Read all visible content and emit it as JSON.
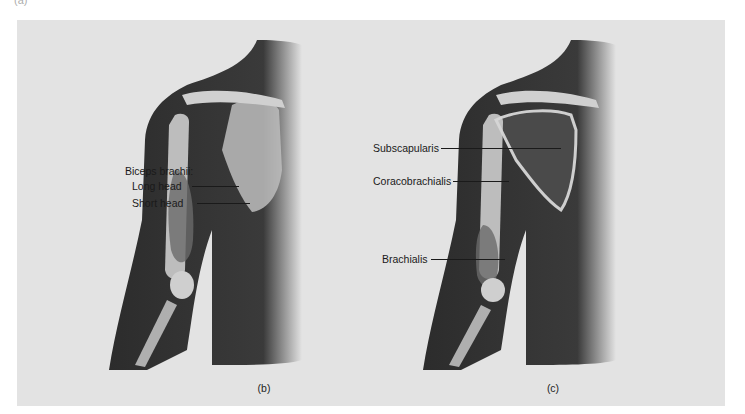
{
  "figure": {
    "partial_label_top": "(a)",
    "background_color": "#e3e3e3",
    "panels": [
      {
        "id": "b",
        "caption": "(b)",
        "group_label": "Biceps brachii:",
        "labels": [
          {
            "text": "Long head"
          },
          {
            "text": "Short head"
          }
        ]
      },
      {
        "id": "c",
        "caption": "(c)",
        "labels": [
          {
            "text": "Subscapularis"
          },
          {
            "text": "Coracobrachialis"
          },
          {
            "text": "Brachialis"
          }
        ]
      }
    ]
  }
}
